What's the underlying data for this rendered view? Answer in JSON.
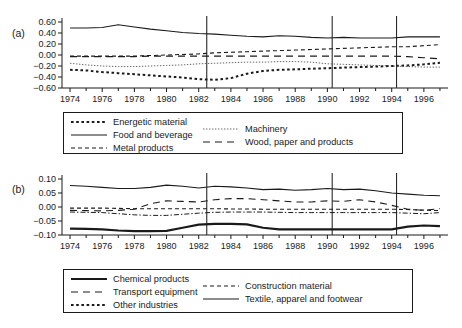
{
  "figure": {
    "panel_a_label": "(a)",
    "panel_b_label": "(b)"
  },
  "chart_data": [
    {
      "id": "panel-a",
      "type": "line",
      "title": "",
      "xlabel": "",
      "ylabel": "",
      "xlim": [
        1973.5,
        1997.5
      ],
      "ylim": [
        -0.6,
        0.6
      ],
      "grid": false,
      "legend_position": "below",
      "xticks": [
        1974,
        1976,
        1978,
        1980,
        1982,
        1984,
        1986,
        1988,
        1990,
        1992,
        1994,
        1996
      ],
      "xtick_labels": [
        "1974",
        "1976",
        "1978",
        "1980",
        "1982",
        "1984",
        "1986",
        "1988",
        "1990",
        "1992",
        "1994",
        "1996"
      ],
      "yticks": [
        0.6,
        0.4,
        0.2,
        0.0,
        -0.2,
        -0.4,
        -0.6
      ],
      "ytick_labels": [
        "0.60",
        "0.40",
        "0.20",
        "0.00",
        "−0.20",
        "−0.40",
        "−0.60"
      ],
      "vertical_reference_lines": [
        1982.5,
        1990.3,
        1994.3
      ],
      "x": [
        1974,
        1975,
        1976,
        1977,
        1978,
        1979,
        1980,
        1981,
        1982,
        1983,
        1984,
        1985,
        1986,
        1987,
        1988,
        1989,
        1990,
        1991,
        1992,
        1993,
        1994,
        1995,
        1996,
        1997
      ],
      "series": [
        {
          "name": "Energetic material",
          "style": "dotted-square",
          "values": [
            -0.27,
            -0.28,
            -0.31,
            -0.33,
            -0.35,
            -0.37,
            -0.39,
            -0.41,
            -0.44,
            -0.45,
            -0.42,
            -0.34,
            -0.29,
            -0.27,
            -0.26,
            -0.25,
            -0.24,
            -0.23,
            -0.22,
            -0.21,
            -0.2,
            -0.19,
            -0.17,
            -0.14
          ]
        },
        {
          "name": "Food and beverage",
          "style": "solid",
          "values": [
            0.49,
            0.49,
            0.5,
            0.55,
            0.51,
            0.47,
            0.44,
            0.41,
            0.39,
            0.38,
            0.36,
            0.34,
            0.33,
            0.35,
            0.34,
            0.32,
            0.31,
            0.32,
            0.31,
            0.31,
            0.31,
            0.33,
            0.33,
            0.33
          ]
        },
        {
          "name": "Metal products",
          "style": "dashed-small",
          "values": [
            -0.02,
            -0.02,
            -0.02,
            -0.02,
            -0.02,
            -0.01,
            0.0,
            0.01,
            0.02,
            0.04,
            0.05,
            0.06,
            0.07,
            0.08,
            0.09,
            0.1,
            0.11,
            0.12,
            0.13,
            0.14,
            0.15,
            0.15,
            0.17,
            0.19
          ]
        },
        {
          "name": "Machinery",
          "style": "dotted-fine",
          "values": [
            -0.15,
            -0.18,
            -0.2,
            -0.21,
            -0.21,
            -0.2,
            -0.19,
            -0.18,
            -0.16,
            -0.15,
            -0.14,
            -0.13,
            -0.13,
            -0.12,
            -0.12,
            -0.13,
            -0.16,
            -0.17,
            -0.18,
            -0.19,
            -0.2,
            -0.21,
            -0.22,
            -0.22
          ]
        },
        {
          "name": "Wood, paper and products",
          "style": "dashed-large",
          "values": [
            -0.03,
            -0.03,
            -0.03,
            -0.03,
            -0.03,
            -0.02,
            -0.02,
            -0.02,
            -0.02,
            -0.02,
            -0.02,
            -0.02,
            -0.02,
            -0.02,
            -0.02,
            -0.02,
            -0.02,
            -0.02,
            -0.02,
            -0.02,
            -0.02,
            -0.03,
            -0.05,
            -0.07
          ]
        }
      ],
      "legend": [
        {
          "label": "Energetic material",
          "style": "dotted-square"
        },
        {
          "label": "Food and beverage",
          "style": "solid"
        },
        {
          "label": "Metal products",
          "style": "dashed-small"
        },
        {
          "label": "Machinery",
          "style": "dotted-fine"
        },
        {
          "label": "Wood, paper and products",
          "style": "dashed-large"
        }
      ]
    },
    {
      "id": "panel-b",
      "type": "line",
      "title": "",
      "xlabel": "",
      "ylabel": "",
      "xlim": [
        1973.5,
        1997.5
      ],
      "ylim": [
        -0.1,
        0.1
      ],
      "grid": false,
      "legend_position": "below",
      "xticks": [
        1974,
        1976,
        1978,
        1980,
        1982,
        1984,
        1986,
        1988,
        1990,
        1992,
        1994,
        1996
      ],
      "xtick_labels": [
        "1974",
        "1976",
        "1978",
        "1980",
        "1982",
        "1984",
        "1986",
        "1988",
        "1990",
        "1992",
        "1994",
        "1996"
      ],
      "yticks": [
        0.1,
        0.05,
        0.0,
        -0.05,
        -0.1
      ],
      "ytick_labels": [
        "0.10",
        "0.05",
        "0.00",
        "−0.05",
        "−0.10"
      ],
      "vertical_reference_lines": [
        1982.5,
        1990.3,
        1994.3
      ],
      "x": [
        1974,
        1975,
        1976,
        1977,
        1978,
        1979,
        1980,
        1981,
        1982,
        1983,
        1984,
        1985,
        1986,
        1987,
        1988,
        1989,
        1990,
        1991,
        1992,
        1993,
        1994,
        1995,
        1996,
        1997
      ],
      "series": [
        {
          "name": "Chemical products",
          "style": "thick-solid",
          "values": [
            -0.077,
            -0.078,
            -0.08,
            -0.084,
            -0.086,
            -0.086,
            -0.085,
            -0.074,
            -0.063,
            -0.06,
            -0.06,
            -0.062,
            -0.074,
            -0.08,
            -0.08,
            -0.08,
            -0.08,
            -0.08,
            -0.08,
            -0.08,
            -0.08,
            -0.07,
            -0.066,
            -0.068
          ]
        },
        {
          "name": "Transport equipment",
          "style": "dashed-large",
          "values": [
            -0.012,
            -0.013,
            -0.014,
            -0.012,
            -0.008,
            0.012,
            0.022,
            0.02,
            0.018,
            0.026,
            0.03,
            0.03,
            0.026,
            0.022,
            0.018,
            0.018,
            0.022,
            0.02,
            0.026,
            0.018,
            0.006,
            -0.008,
            -0.012,
            -0.006
          ]
        },
        {
          "name": "Other industries",
          "style": "dashdot",
          "values": [
            -0.018,
            -0.019,
            -0.02,
            -0.024,
            -0.028,
            -0.03,
            -0.03,
            -0.026,
            -0.022,
            -0.019,
            -0.018,
            -0.018,
            -0.018,
            -0.019,
            -0.02,
            -0.02,
            -0.02,
            -0.02,
            -0.02,
            -0.02,
            -0.02,
            -0.022,
            -0.024,
            -0.02
          ]
        },
        {
          "name": "Construction material",
          "style": "dashed-small",
          "values": [
            -0.004,
            -0.004,
            -0.004,
            -0.005,
            -0.006,
            -0.006,
            -0.006,
            -0.006,
            -0.006,
            -0.006,
            -0.007,
            -0.007,
            -0.008,
            -0.008,
            -0.008,
            -0.008,
            -0.008,
            -0.008,
            -0.008,
            -0.008,
            -0.008,
            -0.009,
            -0.011,
            -0.013
          ]
        },
        {
          "name": "Textile, apparel and footwear",
          "style": "solid",
          "values": [
            0.077,
            0.074,
            0.07,
            0.066,
            0.066,
            0.07,
            0.078,
            0.074,
            0.068,
            0.074,
            0.072,
            0.068,
            0.062,
            0.064,
            0.06,
            0.062,
            0.066,
            0.062,
            0.064,
            0.058,
            0.05,
            0.046,
            0.042,
            0.04
          ]
        }
      ],
      "legend": [
        {
          "label": "Chemical products",
          "style": "thick-solid"
        },
        {
          "label": "Transport equipment",
          "style": "dashed-large"
        },
        {
          "label": "Other industries",
          "style": "dashed-small-dotted"
        },
        {
          "label": "Construction material",
          "style": "dashed-small"
        },
        {
          "label": "Textile, apparel and footwear",
          "style": "solid"
        }
      ]
    }
  ]
}
